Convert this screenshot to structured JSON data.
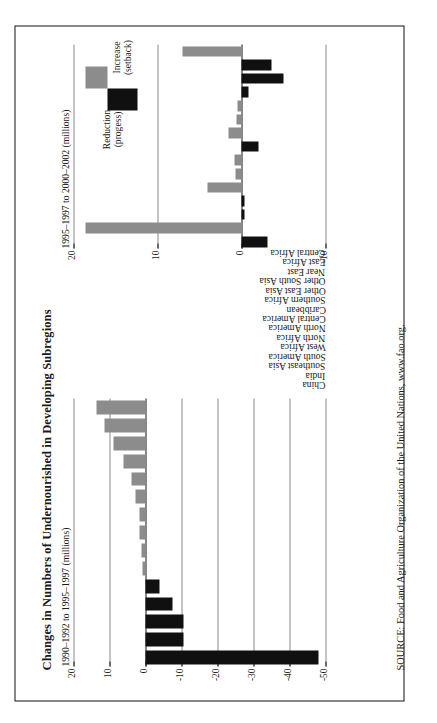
{
  "figure": {
    "title": "Changes in Numbers of Undernourished in Developing Subregions",
    "source": "SOURCE: Food and Agriculture Organization of the United Nations, www.fao.org."
  },
  "legend": {
    "reduction_label": "Reduction (progess)",
    "increase_label": "Increase (setback)",
    "reduction_color": "#101010",
    "increase_color": "#8c8c8c"
  },
  "categories": [
    "China",
    "India",
    "Southeast Asia",
    "South America",
    "West Africa",
    "North Africa",
    "North America",
    "Central America",
    "Caribbean",
    "Southern Africa",
    "Other East Asia",
    "Other South Asia",
    "Near East",
    "East Africa",
    "Central Africa"
  ],
  "chart_data": [
    {
      "type": "bar",
      "id": "panel-left",
      "title": "1990–1992 to 1995–1997 (millions)",
      "ylabel": "1990–1992 to 1995–1997 (millions)",
      "xlabel": "",
      "orientation": "vertical",
      "ylim": [
        -50,
        20
      ],
      "yticks": [
        -50,
        -40,
        -30,
        -20,
        -10,
        0,
        10,
        20
      ],
      "ytick_labels": [
        "-50",
        "-40",
        "-30",
        "-20",
        "-10",
        "0",
        "10",
        "20"
      ],
      "grid": true,
      "categories": [
        "China",
        "India",
        "Southeast Asia",
        "South America",
        "West Africa",
        "North Africa",
        "North America",
        "Central America",
        "Caribbean",
        "Southern Africa",
        "Other East Asia",
        "Other South Asia",
        "Near East",
        "East Africa",
        "Central Africa"
      ],
      "values": [
        -48.0,
        -10.5,
        -10.5,
        -7.5,
        -4.0,
        0.8,
        1.0,
        1.6,
        1.6,
        2.7,
        3.8,
        6.0,
        9.0,
        11.5,
        13.5
      ]
    },
    {
      "type": "bar",
      "id": "panel-right",
      "title": "1995–1997 to 2000–2002 (millions)",
      "ylabel": "1995–1997 to 2000–2002 (millions)",
      "xlabel": "",
      "orientation": "vertical",
      "ylim": [
        -10,
        20
      ],
      "yticks": [
        -10,
        0,
        10,
        20
      ],
      "ytick_labels": [
        "-10",
        "0",
        "10",
        "20"
      ],
      "grid": true,
      "categories": [
        "China",
        "India",
        "Southeast Asia",
        "South America",
        "West Africa",
        "North Africa",
        "North America",
        "Central America",
        "Caribbean",
        "Southern Africa",
        "Other East Asia",
        "Other South Asia",
        "Near East",
        "East Africa",
        "Central Africa"
      ],
      "values": [
        -3.1,
        18.6,
        -0.4,
        -0.4,
        4.1,
        0.7,
        0.8,
        -2.0,
        1.5,
        0.6,
        0.5,
        -0.8,
        -5.0,
        -3.6,
        7.0
      ]
    }
  ]
}
